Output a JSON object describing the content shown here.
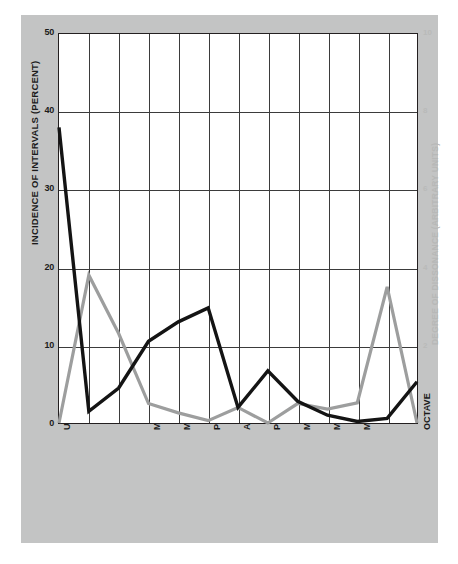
{
  "chart_data": {
    "type": "line",
    "title": "",
    "xlabel": "",
    "ylabel": "INCIDENCE OF INTERVALS (PERCENT)",
    "y2label": "DEGREE OF DISSONANCE (ARBITRARY UNITS)",
    "ylim": [
      0,
      50
    ],
    "yticks": [
      0,
      10,
      20,
      30,
      40,
      50
    ],
    "ytick_labels": [
      "0",
      "10",
      "20",
      "30",
      "40",
      "50"
    ],
    "y2lim": [
      0,
      10
    ],
    "y2ticks": [
      0,
      2,
      4,
      6,
      8,
      10
    ],
    "y2tick_labels": [
      "0",
      "2",
      "4",
      "6",
      "8",
      "10"
    ],
    "grid": true,
    "legend": "none",
    "x": [
      0,
      1,
      2,
      3,
      4,
      5,
      6,
      7,
      8,
      9,
      10,
      11,
      12
    ],
    "categories": [
      "UNISON",
      "",
      "",
      "MINOR THIRD",
      "MAJOR THIRD",
      "PERFECT FOURTH",
      "AUGMENTED FOURTH",
      "PERFECT FIFTH",
      "MINOR SIXTH",
      "MAJOR SIXTH",
      "MINOR SEVENTH",
      "",
      "OCTAVE"
    ],
    "xtick_labels": [
      "UNISON",
      "MINOR THIRD",
      "MAJOR THIRD",
      "PERFECT FOURTH",
      "AUGMENTED FOURTH",
      "PERFECT FIFTH",
      "MINOR SIXTH",
      "MAJOR SIXTH",
      "MINOR SEVENTH",
      "OCTAVE"
    ],
    "xtick_indices": [
      0,
      3,
      4,
      5,
      6,
      7,
      8,
      9,
      10,
      12
    ],
    "series": [
      {
        "name": "INCIDENCE OF INTERVALS (PERCENT)",
        "color": "#141414",
        "axis": "left",
        "values": [
          38.0,
          1.5,
          4.5,
          10.5,
          13.0,
          14.8,
          2.0,
          6.7,
          2.8,
          1.0,
          0.2,
          0.6,
          5.3
        ]
      },
      {
        "name": "DEGREE OF DISSONANCE (ARBITRARY UNITS)",
        "color": "#9d9e9e",
        "axis": "left_scaled",
        "values": [
          0.0,
          19.0,
          11.5,
          2.5,
          1.3,
          0.3,
          2.0,
          0.0,
          2.5,
          1.8,
          2.6,
          17.5,
          0.0
        ]
      }
    ]
  }
}
